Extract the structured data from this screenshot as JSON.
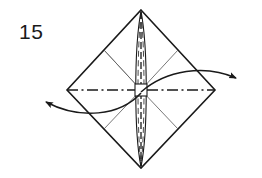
{
  "figure": {
    "step_number": "15",
    "background_color": "#ffffff",
    "ink_color": "#1a1a1a",
    "thin_line_color": "#555555"
  },
  "labels": {
    "step_number": "15"
  },
  "chart_data": {
    "type": "diagram",
    "annotations": [
      "15"
    ],
    "shapes": [
      {
        "name": "outer-diamond",
        "kind": "polygon",
        "stroke": "#1a1a1a",
        "stroke_width": 1.6,
        "points": [
          [
            141,
            10
          ],
          [
            215,
            90
          ],
          [
            141,
            168
          ],
          [
            67,
            90
          ]
        ]
      },
      {
        "name": "horizontal-axis-dashdot",
        "kind": "dash-dot-line",
        "stroke": "#1a1a1a",
        "stroke_width": 1.3,
        "from": [
          67,
          90
        ],
        "to": [
          215,
          90
        ]
      },
      {
        "name": "center-spindle",
        "kind": "lens",
        "stroke": "#1a1a1a",
        "stroke_width": 1.1,
        "top": [
          141,
          12
        ],
        "bottom": [
          141,
          166
        ],
        "half_width": 6
      },
      {
        "name": "center-square",
        "kind": "rect",
        "stroke": "#1a1a1a",
        "fill": "#ffffff",
        "x": 135,
        "y": 84,
        "width": 12,
        "height": 12
      },
      {
        "name": "crease-upper-left",
        "kind": "line",
        "stroke": "#555555",
        "from": [
          104,
          50
        ],
        "to": [
          141,
          90
        ]
      },
      {
        "name": "crease-upper-right",
        "kind": "line",
        "stroke": "#555555",
        "from": [
          178,
          50
        ],
        "to": [
          141,
          90
        ]
      },
      {
        "name": "crease-lower-left",
        "kind": "line",
        "stroke": "#555555",
        "from": [
          104,
          129
        ],
        "to": [
          141,
          90
        ]
      },
      {
        "name": "crease-lower-right",
        "kind": "line",
        "stroke": "#555555",
        "from": [
          178,
          129
        ],
        "to": [
          141,
          90
        ]
      },
      {
        "name": "arrow-left",
        "kind": "curved-arrow",
        "stroke": "#1a1a1a",
        "direction": "left",
        "from": [
          141,
          90
        ],
        "control": [
          95,
          116
        ],
        "to": [
          42,
          101
        ]
      },
      {
        "name": "arrow-right",
        "kind": "curved-arrow",
        "stroke": "#1a1a1a",
        "direction": "right",
        "from": [
          141,
          92
        ],
        "control": [
          190,
          66
        ],
        "to": [
          240,
          79
        ]
      }
    ]
  }
}
